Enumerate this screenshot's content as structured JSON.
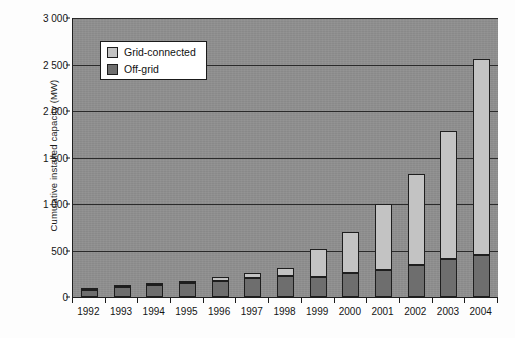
{
  "chart_data": {
    "type": "bar",
    "subtype": "stacked-column",
    "title": "",
    "xlabel": "",
    "ylabel": "Cumulative installed capacity (MW)",
    "ylim": [
      0,
      3000
    ],
    "ytick_labels": [
      "0",
      "500",
      "1 000",
      "1 500",
      "2 000",
      "2 500",
      "3 000"
    ],
    "ytick_values": [
      0,
      500,
      1000,
      1500,
      2000,
      2500,
      3000
    ],
    "grid": true,
    "grid_axis": "y",
    "legend_position": "upper-left-inside",
    "categories": [
      "1992",
      "1993",
      "1994",
      "1995",
      "1996",
      "1997",
      "1998",
      "1999",
      "2000",
      "2001",
      "2002",
      "2003",
      "2004"
    ],
    "series": [
      {
        "name": "Off-grid",
        "color": "#6e6e6e",
        "values": [
          75,
          105,
          125,
          150,
          175,
          200,
          225,
          210,
          260,
          290,
          340,
          410,
          450
        ]
      },
      {
        "name": "Grid-connected",
        "color": "#c3c3c3",
        "values": [
          5,
          15,
          20,
          25,
          35,
          55,
          85,
          310,
          440,
          710,
          980,
          1375,
          2110
        ]
      }
    ],
    "totals": [
      80,
      120,
      145,
      175,
      210,
      255,
      310,
      520,
      700,
      1000,
      1320,
      1785,
      2560
    ],
    "colors": {
      "plot_background": "#8f8f8f",
      "gridline": "#2a2a2a",
      "axis": "#1f1f1f",
      "grid_connected": "#c3c3c3",
      "off_grid": "#6e6e6e",
      "legend_background": "#ffffff",
      "page_background": "#fdfdfd"
    }
  },
  "legend": {
    "items": [
      {
        "label": "Grid-connected",
        "swatch": "#c3c3c3"
      },
      {
        "label": "Off-grid",
        "swatch": "#6e6e6e"
      }
    ]
  }
}
